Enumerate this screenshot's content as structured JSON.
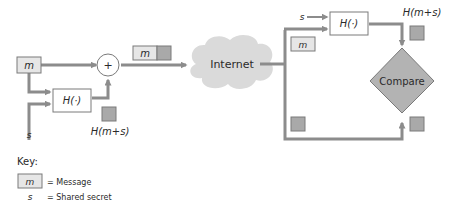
{
  "diagram": {
    "sender": {
      "message_label": "m",
      "secret_label": "s",
      "hash_function_label": "H(·)",
      "hash_output_label": "H(m+s)",
      "concat_symbol": "+"
    },
    "packet": {
      "message_label": "m"
    },
    "network": {
      "label": "Internet"
    },
    "receiver": {
      "secret_label": "s",
      "hash_function_label": "H(·)",
      "hash_output_label": "H(m+s)",
      "message_label": "m",
      "compare_label": "Compare"
    },
    "key": {
      "title": "Key:",
      "items": [
        {
          "symbol": "m",
          "description": "= Message"
        },
        {
          "symbol": "s",
          "description": "= Shared secret"
        }
      ]
    },
    "colors": {
      "line": "#8c8c8c",
      "box_stroke": "#7a7a7a",
      "message_fill": "#e6e6e6",
      "hash_fill": "#a9a9a9",
      "compare_fill": "#b3b3b3",
      "cloud_fill": "#dadada",
      "background": "#ffffff"
    }
  }
}
